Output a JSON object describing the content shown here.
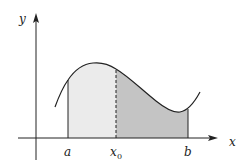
{
  "diagram": {
    "type": "definite-integral-area-split",
    "axes": {
      "x_label": "x",
      "y_label": "y"
    },
    "points": {
      "a": {
        "label": "a"
      },
      "x0": {
        "label": "x",
        "subscript": "0"
      },
      "b": {
        "label": "b"
      }
    },
    "regions": [
      {
        "name": "area-a-to-x0",
        "from": "a",
        "to": "x0",
        "fill": "#ebebeb"
      },
      {
        "name": "area-x0-to-b",
        "from": "x0",
        "to": "b",
        "fill": "#c4c4c4"
      }
    ],
    "colors": {
      "stroke": "#222222",
      "light_fill": "#ebebeb",
      "dark_fill": "#c4c4c4",
      "background": "#ffffff"
    }
  }
}
